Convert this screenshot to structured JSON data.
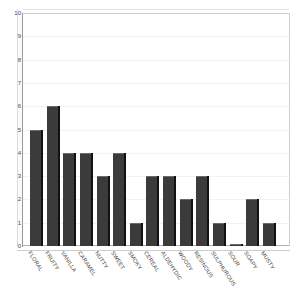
{
  "chart_data": {
    "type": "bar",
    "title": "",
    "xlabel": "",
    "ylabel": "",
    "ylim": [
      0,
      10
    ],
    "ytick_labels": [
      "10",
      "9",
      "8",
      "7",
      "6",
      "5",
      "4",
      "3",
      "2",
      "1",
      "0"
    ],
    "yticks": [
      10,
      9,
      8,
      7,
      6,
      5,
      4,
      3,
      2,
      1,
      0
    ],
    "grid": false,
    "legend": "none",
    "categories": [
      "FLORAL",
      "FRUITY",
      "VANILLA",
      "CARAMEL",
      "NUTTY",
      "SWEET",
      "SMOKY",
      "CEREAL",
      "ALDEHYDIC",
      "WOODY",
      "RESINOUS",
      "SULPHUROUS",
      "SOUR",
      "SOAPY",
      "MUSTY"
    ],
    "values": [
      5,
      6,
      4,
      4,
      3,
      4,
      1,
      3,
      3,
      2,
      3,
      1,
      0,
      2,
      1
    ],
    "bar_color": "#3b3b3b",
    "bar_edge_color": "#121212",
    "background_color": "#ffffff",
    "axis_color": "#9a9a9a"
  }
}
